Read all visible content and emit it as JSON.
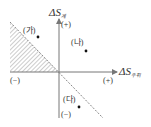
{
  "axes": {
    "y_label_main": "ΔS",
    "y_label_sub": "계",
    "x_label_main": "ΔS",
    "x_label_sub": "주위",
    "y_positive": "(+)",
    "y_negative": "(−)",
    "x_positive": "(+)",
    "x_negative": "(−)"
  },
  "points": [
    {
      "label": "(가)",
      "quadrant": "II"
    },
    {
      "label": "(나)",
      "quadrant": "I"
    },
    {
      "label": "(다)",
      "quadrant": "IV"
    }
  ],
  "regions": {
    "hatched": "region below the dashed line in quadrant II"
  },
  "colors": {
    "axis": "#777777",
    "hatch": "#999999",
    "dashed_line": "#777777",
    "point": "#111111"
  }
}
